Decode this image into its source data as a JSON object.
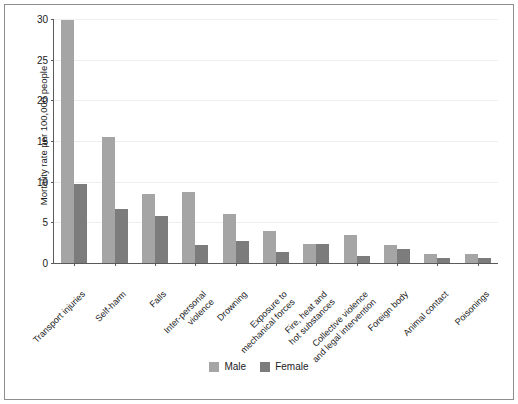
{
  "chart_data": {
    "type": "bar",
    "title": "",
    "subtitle": "",
    "xlabel": "",
    "ylabel": "Mortality rate per 100,000 people",
    "ylim": [
      0,
      30
    ],
    "yticks": [
      0,
      5,
      10,
      15,
      20,
      25,
      30
    ],
    "ytick_labels": [
      "0",
      "5",
      "10",
      "15",
      "20",
      "25",
      "30"
    ],
    "grid": true,
    "grid_axis": "y",
    "legend_position": "bottom-center",
    "categories": [
      "Transport injuries",
      "Self-harm",
      "Falls",
      "Inter-personal\nviolence",
      "Drowning",
      "Exposure to\nmechanical forces",
      "Fire, heat and\nhot substances",
      "Collective violence\nand legal intervention",
      "Foreign body",
      "Animal contact",
      "Poisonings"
    ],
    "series": [
      {
        "name": "Male",
        "color": "#a5a5a5",
        "values": [
          29.9,
          15.5,
          8.5,
          8.7,
          6.0,
          3.9,
          2.3,
          3.4,
          2.2,
          1.1,
          1.1
        ]
      },
      {
        "name": "Female",
        "color": "#7c7c7c",
        "values": [
          9.7,
          6.7,
          5.8,
          2.2,
          2.7,
          1.4,
          2.3,
          0.9,
          1.7,
          0.6,
          0.6
        ]
      }
    ]
  },
  "legend": {
    "items": [
      {
        "label": "Male",
        "color": "#a5a5a5"
      },
      {
        "label": "Female",
        "color": "#7c7c7c"
      }
    ]
  }
}
